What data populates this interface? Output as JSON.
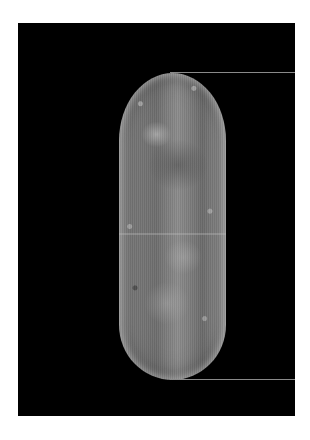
{
  "image": {
    "subject": "embryo micrograph",
    "description": "Grayscale fluorescence micrograph of an elongated oval embryo on a black background with two horizontal marker lines at the top and bottom poles",
    "colors": {
      "page_background": "#ffffff",
      "frame_background": "#000000",
      "marker_line": "#8a8a8a"
    },
    "frame": {
      "x": 18,
      "y": 23,
      "width": 277,
      "height": 393
    },
    "embryo": {
      "x": 119,
      "y": 73,
      "width": 107,
      "height": 307
    },
    "marker_lines": [
      {
        "x1": 170,
        "x2": 295,
        "y": 72
      },
      {
        "x1": 170,
        "x2": 295,
        "y": 379
      }
    ]
  }
}
